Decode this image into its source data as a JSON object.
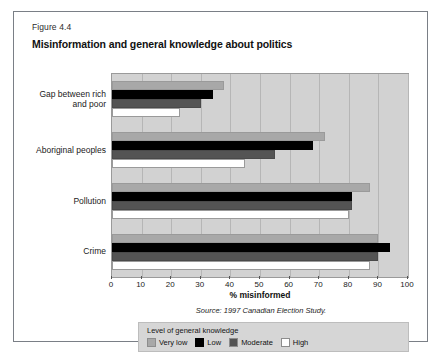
{
  "figure": {
    "number": "Figure 4.4",
    "title": "Misinformation and general knowledge about politics",
    "source": "Source: 1997 Canadian Election Study."
  },
  "legend": {
    "title": "Level of general knowledge",
    "items": [
      {
        "label": "Very low",
        "color": "#a8a8a8",
        "swatch": "very-low"
      },
      {
        "label": "Low",
        "color": "#000000",
        "swatch": "low"
      },
      {
        "label": "Moderate",
        "color": "#545454",
        "swatch": "moderate"
      },
      {
        "label": "High",
        "color": "#ffffff",
        "swatch": "high"
      }
    ]
  },
  "chart_data": {
    "type": "bar",
    "orientation": "horizontal",
    "title": "Misinformation and general knowledge about politics",
    "xlabel": "% misinformed",
    "ylabel": "",
    "xlim": [
      0,
      100
    ],
    "xticks": [
      0,
      10,
      20,
      30,
      40,
      50,
      60,
      70,
      80,
      90,
      100
    ],
    "xtick_labels": [
      "0",
      "10",
      "20",
      "30",
      "40",
      "50",
      "60",
      "70",
      "80",
      "90",
      "100"
    ],
    "grid": true,
    "legend_position": "below",
    "categories": [
      "Gap between rich\nand poor",
      "Aboriginal peoples",
      "Pollution",
      "Crime"
    ],
    "category_labels_plain": [
      "Gap between rich and poor",
      "Aboriginal peoples",
      "Pollution",
      "Crime"
    ],
    "series": [
      {
        "name": "Very low",
        "color": "#a8a8a8",
        "values": [
          38,
          72,
          87,
          90
        ]
      },
      {
        "name": "Low",
        "color": "#000000",
        "values": [
          34,
          68,
          81,
          94
        ]
      },
      {
        "name": "Moderate",
        "color": "#545454",
        "values": [
          30,
          55,
          81,
          90
        ]
      },
      {
        "name": "High",
        "color": "#ffffff",
        "values": [
          23,
          45,
          80,
          87
        ]
      }
    ]
  }
}
